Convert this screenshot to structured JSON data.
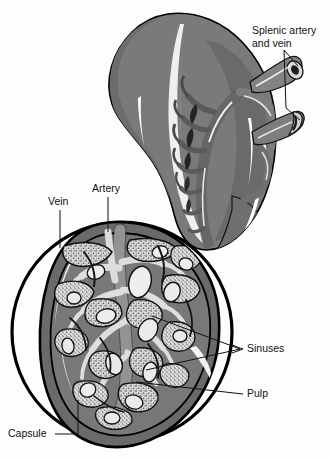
{
  "figure": {
    "background_color": "#fdfdfd",
    "ink_color": "#111111"
  },
  "palette": {
    "organ_body": "#7a7a7a",
    "organ_body_dark": "#5f5f5f",
    "organ_shadow": "#4a4a4a",
    "vessel_gray": "#8b8b8b",
    "vessel_dark": "#4d4d4d",
    "highlight_white": "#ffffff",
    "pulp_gray": "#6e6e6e",
    "sinus_light": "#e2e2e2",
    "stipple_light": "#d3d3d3",
    "capsule_band": "#6a6a6a",
    "outline_black": "#000000"
  },
  "labels": [
    {
      "id": "splenic-artery-and-vein",
      "line1": "Splenic artery",
      "line2": "and vein",
      "x": 252,
      "y": 34,
      "anchor": "start"
    },
    {
      "id": "vein",
      "line1": "Vein",
      "line2": "",
      "x": 48,
      "y": 205,
      "anchor": "start"
    },
    {
      "id": "artery",
      "line1": "Artery",
      "line2": "",
      "x": 92,
      "y": 192,
      "anchor": "start"
    },
    {
      "id": "sinuses",
      "line1": "Sinuses",
      "line2": "",
      "x": 247,
      "y": 352,
      "anchor": "start"
    },
    {
      "id": "pulp",
      "line1": "Pulp",
      "line2": "",
      "x": 247,
      "y": 397,
      "anchor": "start"
    },
    {
      "id": "capsule",
      "line1": "Capsule",
      "line2": "",
      "x": 8,
      "y": 437,
      "anchor": "start"
    }
  ],
  "structures": {
    "organ_name": "spleen",
    "inset_name": "magnified cross section",
    "inset_circle": {
      "cx": 122,
      "cy": 332,
      "r": 110
    }
  }
}
